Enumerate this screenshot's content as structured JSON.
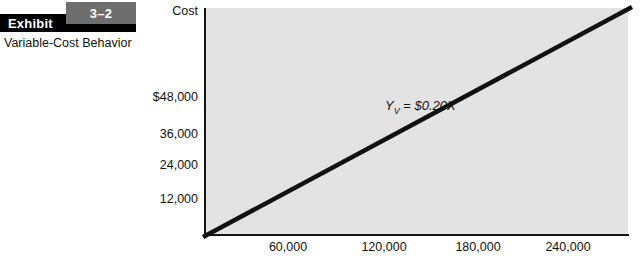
{
  "exhibit": {
    "number": "3–2",
    "label": "Exhibit",
    "subtitle": "Variable-Cost Behavior"
  },
  "colors": {
    "plot_background": "#e3e3e3",
    "axis": "#141414",
    "line": "#111111",
    "exhibit_bar": "#000000",
    "exhibit_number_box": "#6e6e6e"
  },
  "chart_data": {
    "type": "line",
    "title": "Variable-Cost Behavior",
    "xlabel": "",
    "ylabel": "Cost",
    "equation": {
      "lhs": "Y",
      "subscript": "V",
      "operator": "=",
      "rhs": "$0.20X",
      "display": "Yv = $0.20X"
    },
    "slope": 0.2,
    "intercept": 0,
    "x": [
      0,
      300000
    ],
    "y": [
      0,
      60000
    ],
    "xlim": [
      0,
      300000
    ],
    "ylim": [
      0,
      60000
    ],
    "grid": false,
    "legend": null,
    "y_ticks": [
      {
        "value": 48000,
        "label": "$48,000"
      },
      {
        "value": 36000,
        "label": "36,000"
      },
      {
        "value": 24000,
        "label": "24,000"
      },
      {
        "value": 12000,
        "label": "12,000"
      }
    ],
    "x_ticks": [
      {
        "value": 60000,
        "label": "60,000"
      },
      {
        "value": 120000,
        "label": "120,000"
      },
      {
        "value": 180000,
        "label": "180,000"
      },
      {
        "value": 240000,
        "label": "240,000"
      }
    ],
    "series": [
      {
        "name": "Variable cost",
        "points": [
          [
            0,
            0
          ],
          [
            300000,
            60000
          ]
        ]
      }
    ]
  }
}
